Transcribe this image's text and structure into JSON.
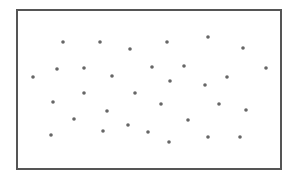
{
  "chart_data": {
    "type": "scatter",
    "title": "",
    "xlabel": "",
    "ylabel": "",
    "grid": false,
    "legend": null,
    "axes_ticks": false,
    "frame": {
      "left": 17,
      "top": 10,
      "right": 281,
      "bottom": 169,
      "color": "#555555",
      "width": 2
    },
    "marker": {
      "color": "#666666",
      "radius": 1.8
    },
    "points_pixel": [
      {
        "x": 63,
        "y": 42
      },
      {
        "x": 100,
        "y": 42
      },
      {
        "x": 130,
        "y": 49
      },
      {
        "x": 167,
        "y": 42
      },
      {
        "x": 208,
        "y": 37
      },
      {
        "x": 243,
        "y": 48
      },
      {
        "x": 33,
        "y": 77
      },
      {
        "x": 57,
        "y": 69
      },
      {
        "x": 84,
        "y": 68
      },
      {
        "x": 112,
        "y": 76
      },
      {
        "x": 152,
        "y": 67
      },
      {
        "x": 184,
        "y": 66
      },
      {
        "x": 170,
        "y": 81
      },
      {
        "x": 205,
        "y": 85
      },
      {
        "x": 227,
        "y": 77
      },
      {
        "x": 266,
        "y": 68
      },
      {
        "x": 53,
        "y": 102
      },
      {
        "x": 84,
        "y": 93
      },
      {
        "x": 135,
        "y": 93
      },
      {
        "x": 107,
        "y": 111
      },
      {
        "x": 74,
        "y": 119
      },
      {
        "x": 161,
        "y": 104
      },
      {
        "x": 188,
        "y": 120
      },
      {
        "x": 219,
        "y": 104
      },
      {
        "x": 246,
        "y": 110
      },
      {
        "x": 51,
        "y": 135
      },
      {
        "x": 103,
        "y": 131
      },
      {
        "x": 128,
        "y": 125
      },
      {
        "x": 148,
        "y": 132
      },
      {
        "x": 169,
        "y": 142
      },
      {
        "x": 208,
        "y": 137
      },
      {
        "x": 240,
        "y": 137
      }
    ]
  }
}
